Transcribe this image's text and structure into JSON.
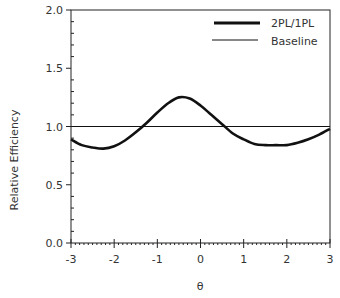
{
  "chart_data": {
    "type": "line",
    "title": "",
    "xlabel": "θ",
    "ylabel": "Relative Efficiency",
    "xlim": [
      -3,
      3
    ],
    "ylim": [
      0.0,
      2.0
    ],
    "x_ticks": [
      "-3",
      "-2",
      "-1",
      "0",
      "1",
      "2",
      "3"
    ],
    "y_ticks": [
      "0.0",
      "0.5",
      "1.0",
      "1.5",
      "2.0"
    ],
    "grid": false,
    "legend_position": "top-right",
    "series": [
      {
        "name": "2PL/1PL",
        "style": "thick",
        "x": [
          -3.0,
          -2.75,
          -2.5,
          -2.25,
          -2.0,
          -1.75,
          -1.5,
          -1.25,
          -1.0,
          -0.75,
          -0.5,
          -0.25,
          0.0,
          0.25,
          0.5,
          0.75,
          1.0,
          1.25,
          1.5,
          1.75,
          2.0,
          2.25,
          2.5,
          2.75,
          3.0
        ],
        "values": [
          0.89,
          0.84,
          0.82,
          0.81,
          0.83,
          0.88,
          0.95,
          1.03,
          1.12,
          1.2,
          1.25,
          1.24,
          1.18,
          1.1,
          1.02,
          0.94,
          0.89,
          0.85,
          0.84,
          0.84,
          0.84,
          0.86,
          0.89,
          0.93,
          0.98
        ]
      },
      {
        "name": "Baseline",
        "style": "thin",
        "x": [
          -3.0,
          3.0
        ],
        "values": [
          1.0,
          1.0
        ]
      }
    ]
  },
  "legend": {
    "items": [
      {
        "label": "2PL/1PL"
      },
      {
        "label": "Baseline"
      }
    ]
  },
  "axes": {
    "xlabel": "θ",
    "ylabel": "Relative Efficiency"
  }
}
